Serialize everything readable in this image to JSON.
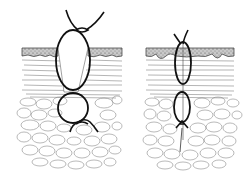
{
  "figure": {
    "title": "",
    "colors": {
      "ink": "#111111",
      "epidermis": "#9a9a9a",
      "dermis_lines": "#6a6a6a",
      "fat_lines": "#8a8a8a",
      "background": "#ffffff"
    },
    "panels": [
      {
        "id": "left",
        "description": "Suture loop with knot tied above skin surface and buried knot in fat layer",
        "knot_top": "above-skin",
        "loops": 2
      },
      {
        "id": "right",
        "description": "Tighter suture loop with cut ends above skin and knot in fat layer",
        "knot_top": "cut-ends",
        "loops": 2
      }
    ],
    "layers": [
      "epidermis",
      "dermis",
      "subcutaneous-fat"
    ]
  }
}
